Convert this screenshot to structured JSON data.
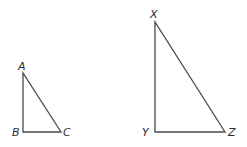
{
  "diagram": {
    "type": "similar-right-triangles",
    "line_color": "#4a4a4a",
    "label_color": "#2b2b2b",
    "triangles": [
      {
        "name": "ABC",
        "right_angle_at": "B",
        "vertices": {
          "A": {
            "label": "A",
            "x": 23,
            "y": 73,
            "lx": 18,
            "ly": 70
          },
          "B": {
            "label": "B",
            "x": 23,
            "y": 132,
            "lx": 12,
            "ly": 136
          },
          "C": {
            "label": "C",
            "x": 61,
            "y": 132,
            "lx": 63,
            "ly": 136
          }
        }
      },
      {
        "name": "XYZ",
        "right_angle_at": "Y",
        "vertices": {
          "X": {
            "label": "X",
            "x": 155,
            "y": 22,
            "lx": 150,
            "ly": 18
          },
          "Y": {
            "label": "Y",
            "x": 155,
            "y": 132,
            "lx": 142,
            "ly": 136
          },
          "Z": {
            "label": "Z",
            "x": 225,
            "y": 132,
            "lx": 228,
            "ly": 136
          }
        }
      }
    ]
  }
}
